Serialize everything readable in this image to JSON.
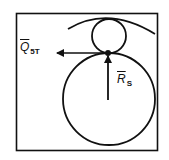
{
  "diagram": {
    "labels": {
      "force_horizontal": {
        "symbol": "Q",
        "subscript": "5T"
      },
      "force_vertical": {
        "symbol": "R",
        "subscript": "S"
      }
    },
    "colors": {
      "stroke": "#111111",
      "background": "#ffffff"
    }
  }
}
